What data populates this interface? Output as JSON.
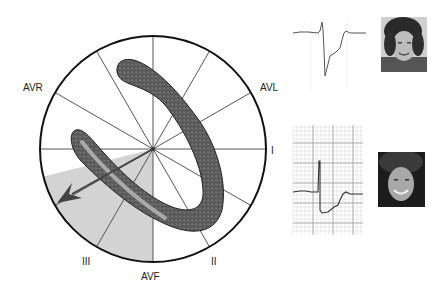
{
  "hexaxial": {
    "leads": [
      {
        "id": "avr",
        "label": "AVR",
        "x": 23,
        "y": 83
      },
      {
        "id": "avl",
        "label": "AVL",
        "x": 260,
        "y": 83
      },
      {
        "id": "i",
        "label": "I",
        "x": 271,
        "y": 146
      },
      {
        "id": "iii",
        "label": "III",
        "x": 82,
        "y": 257
      },
      {
        "id": "avf",
        "label": "AVF",
        "x": 141,
        "y": 272
      },
      {
        "id": "ii",
        "label": "II",
        "x": 211,
        "y": 257
      }
    ],
    "center": {
      "x": 153,
      "y": 149
    },
    "radius": 113,
    "colors": {
      "outline": "#111111",
      "spoke": "#555555",
      "heart": "#5c5c5c",
      "heart_edge": "#222222",
      "inner_strip": "#a8a8a8",
      "shade": "#d2d2d2",
      "arrow": "#444444"
    }
  },
  "ecg_panels": [
    {
      "id": "ecg-top",
      "grid": false
    },
    {
      "id": "ecg-bottom",
      "grid": true
    }
  ],
  "photos": [
    {
      "id": "photo-woman-1",
      "desc": "portrait of woman with short dark hair"
    },
    {
      "id": "photo-woman-2",
      "desc": "portrait of smiling woman with long dark hair"
    }
  ]
}
